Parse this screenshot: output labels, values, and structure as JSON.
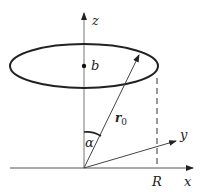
{
  "figure": {
    "labels": {
      "z_axis": "z",
      "x_axis": "x",
      "y_axis": "y",
      "center_point": "b",
      "radius_marker": "R",
      "position_vector": "r",
      "position_vector_subscript": "0",
      "angle": "α"
    },
    "colors": {
      "stroke": "#222222",
      "axis": "#555555",
      "background": "#ffffff"
    },
    "elements": [
      "vertical z-axis with arrow",
      "horizontal x-axis with arrow",
      "oblique y-axis with arrow",
      "circular ring drawn in perspective as ellipse",
      "dot marking center b on z-axis",
      "position vector r0 from origin to ring",
      "angle alpha between z-axis and r0",
      "dashed vertical line at x = R"
    ]
  }
}
